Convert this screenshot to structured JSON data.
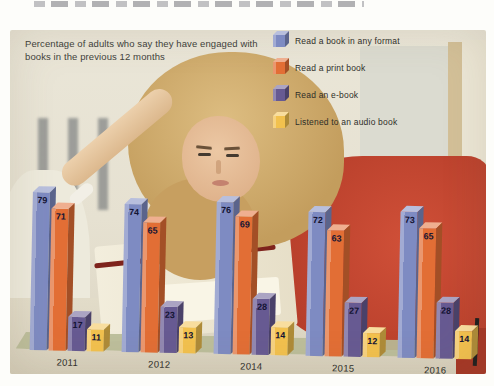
{
  "chart_data": {
    "type": "bar",
    "title": "Percentage of adults who say they have engaged with books in the previous 12 months",
    "categories": [
      "2011",
      "2012",
      "2014",
      "2015",
      "2016"
    ],
    "series": [
      {
        "name": "Read a book in any format",
        "color": "#7e8bc2",
        "values": [
          79,
          74,
          76,
          72,
          73
        ]
      },
      {
        "name": "Read a print book",
        "color": "#e26e35",
        "values": [
          71,
          65,
          69,
          63,
          65
        ]
      },
      {
        "name": "Read an e-book",
        "color": "#675a92",
        "values": [
          17,
          23,
          28,
          27,
          28
        ]
      },
      {
        "name": "Listened to an audio book",
        "color": "#f2c14e",
        "values": [
          11,
          13,
          14,
          12,
          14
        ]
      }
    ],
    "ylim": [
      0,
      100
    ],
    "value_labels": true,
    "legend_position": "top-right",
    "xlabel": "",
    "ylabel": ""
  }
}
